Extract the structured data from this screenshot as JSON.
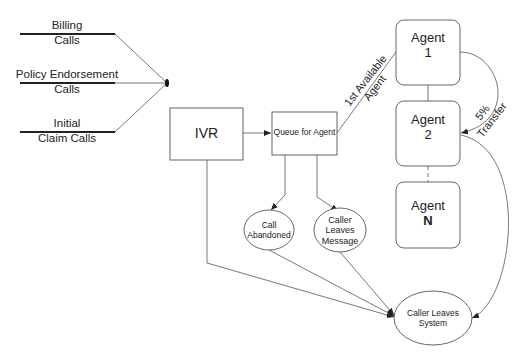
{
  "sources": [
    {
      "line1": "Billing",
      "line2": "Calls"
    },
    {
      "line1": "Policy Endorsement",
      "line2": "Calls"
    },
    {
      "line1": "Initial",
      "line2": "Claim Calls"
    }
  ],
  "nodes": {
    "ivr": "IVR",
    "queue": "Queue for Agent",
    "agent1": {
      "line1": "Agent",
      "line2": "1"
    },
    "agent2": {
      "line1": "Agent",
      "line2": "2"
    },
    "agentN": {
      "line1": "Agent",
      "line2": "N"
    },
    "call_abandoned": {
      "line1": "Call",
      "line2": "Abandoned"
    },
    "caller_leaves_message": {
      "line1": "Caller",
      "line2": "Leaves",
      "line3": "Message"
    },
    "caller_leaves_system": {
      "line1": "Caller Leaves",
      "line2": "System"
    }
  },
  "edge_labels": {
    "first_available": {
      "line1": "1st Available",
      "line2": "Agent"
    },
    "transfer": {
      "line1": "5%",
      "line2": "Transfer"
    }
  },
  "colors": {
    "stroke": "#555555",
    "source_line": "#222222",
    "text": "#222222"
  }
}
